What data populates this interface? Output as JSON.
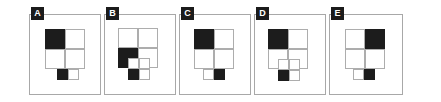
{
  "figure": {
    "type": "multi-panel-geometric-diagram",
    "panel_count": 5,
    "colors": {
      "fill": "#1c1c1c",
      "stroke": "#adadad",
      "frame": "#a8a8a8",
      "background": "#ffffff",
      "badge_background": "#1b1b1b",
      "badge_text": "#ffffff"
    },
    "panels": [
      {
        "label": "A",
        "frame": {
          "x": 29,
          "y": 14,
          "w": 72,
          "h": 81
        },
        "grid": {
          "x": 45,
          "y": 29,
          "w": 40,
          "h": 40,
          "cells": [
            {
              "name": "top-left",
              "filled": true
            },
            {
              "name": "top-right",
              "filled": false
            },
            {
              "name": "bottom-left",
              "filled": false
            },
            {
              "name": "bottom-right",
              "filled": false
            }
          ]
        },
        "subbox": {
          "shape": "2x1",
          "x": 57,
          "y": 69,
          "w": 22,
          "h": 11,
          "overlap": false,
          "cells": [
            {
              "name": "left",
              "filled": true
            },
            {
              "name": "right",
              "filled": false
            }
          ]
        }
      },
      {
        "label": "B",
        "frame": {
          "x": 104,
          "y": 14,
          "w": 72,
          "h": 81
        },
        "grid": {
          "x": 118,
          "y": 28,
          "w": 40,
          "h": 40,
          "cells": [
            {
              "name": "top-left",
              "filled": false
            },
            {
              "name": "top-right",
              "filled": false
            },
            {
              "name": "bottom-left",
              "filled": true
            },
            {
              "name": "bottom-right",
              "filled": false
            }
          ]
        },
        "subbox": {
          "shape": "2x2",
          "x": 128,
          "y": 58,
          "w": 22,
          "h": 22,
          "overlap": true,
          "cells": [
            {
              "name": "top-left",
              "filled": false
            },
            {
              "name": "top-right",
              "filled": false
            },
            {
              "name": "bottom-left",
              "filled": true
            },
            {
              "name": "bottom-right",
              "filled": false
            }
          ]
        }
      },
      {
        "label": "C",
        "frame": {
          "x": 179,
          "y": 14,
          "w": 72,
          "h": 81
        },
        "grid": {
          "x": 194,
          "y": 29,
          "w": 40,
          "h": 40,
          "cells": [
            {
              "name": "top-left",
              "filled": true
            },
            {
              "name": "top-right",
              "filled": false
            },
            {
              "name": "bottom-left",
              "filled": false
            },
            {
              "name": "bottom-right",
              "filled": false
            }
          ]
        },
        "subbox": {
          "shape": "2x1",
          "x": 203,
          "y": 69,
          "w": 22,
          "h": 11,
          "overlap": false,
          "cells": [
            {
              "name": "left",
              "filled": false
            },
            {
              "name": "right",
              "filled": true
            }
          ]
        }
      },
      {
        "label": "D",
        "frame": {
          "x": 254,
          "y": 14,
          "w": 72,
          "h": 81
        },
        "grid": {
          "x": 268,
          "y": 29,
          "w": 40,
          "h": 40,
          "cells": [
            {
              "name": "top-left",
              "filled": true
            },
            {
              "name": "top-right",
              "filled": false
            },
            {
              "name": "bottom-left",
              "filled": false
            },
            {
              "name": "bottom-right",
              "filled": false
            }
          ]
        },
        "subbox": {
          "shape": "2x2",
          "x": 278,
          "y": 59,
          "w": 22,
          "h": 22,
          "overlap": true,
          "cells": [
            {
              "name": "top-left",
              "filled": false
            },
            {
              "name": "top-right",
              "filled": false
            },
            {
              "name": "bottom-left",
              "filled": true
            },
            {
              "name": "bottom-right",
              "filled": false
            }
          ]
        }
      },
      {
        "label": "E",
        "frame": {
          "x": 329,
          "y": 14,
          "w": 74,
          "h": 81
        },
        "grid": {
          "x": 345,
          "y": 29,
          "w": 40,
          "h": 40,
          "cells": [
            {
              "name": "top-left",
              "filled": false
            },
            {
              "name": "top-right",
              "filled": true
            },
            {
              "name": "bottom-left",
              "filled": false
            },
            {
              "name": "bottom-right",
              "filled": false
            }
          ]
        },
        "subbox": {
          "shape": "2x1",
          "x": 353,
          "y": 69,
          "w": 22,
          "h": 11,
          "overlap": false,
          "cells": [
            {
              "name": "left",
              "filled": false
            },
            {
              "name": "right",
              "filled": true
            }
          ]
        }
      }
    ]
  }
}
